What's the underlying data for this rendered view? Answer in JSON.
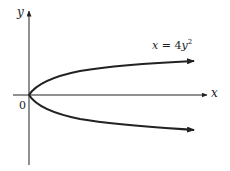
{
  "diagram": {
    "type": "function-graph",
    "axes": {
      "x_label": "x",
      "y_label": "y",
      "origin_label": "0"
    },
    "curve": {
      "equation_lhs": "x",
      "equation_eq": "=",
      "equation_coef": "4",
      "equation_var": "y",
      "equation_exp": "2",
      "shape": "parabola opening right, vertex at origin"
    },
    "colors": {
      "stroke": "#222222",
      "background": "#ffffff"
    }
  }
}
